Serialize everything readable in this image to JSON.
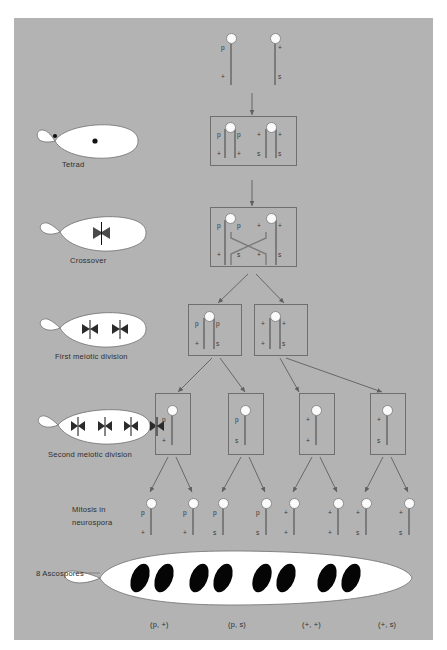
{
  "figure": {
    "background_color": "#b3b3b3",
    "panel_color": "#b3b3b3",
    "line_color": "#7b7b7b",
    "text_color": "#333333",
    "spore_color": "#000000",
    "ascus_color": "#ffffff"
  },
  "stages": [
    {
      "id": "parents",
      "label": ""
    },
    {
      "id": "tetrad",
      "label": "Tetrad"
    },
    {
      "id": "crossover",
      "label": "Crossover"
    },
    {
      "id": "first",
      "label": "First meiotic division"
    },
    {
      "id": "second",
      "label": "Second meiotic division"
    },
    {
      "id": "mitosis",
      "label": "Mitosis in\nneurospora",
      "label_line1": "Mitosis in",
      "label_line2": "neurospora"
    },
    {
      "id": "ascospores",
      "label": "8 Ascospores"
    }
  ],
  "alleles": {
    "p": "p",
    "s": "s",
    "wild": "+"
  },
  "parents": {
    "chromosomes": [
      {
        "top": "p",
        "bottom": "+"
      },
      {
        "top": "+",
        "bottom": "s"
      }
    ]
  },
  "tetrad": {
    "chromatids": [
      {
        "top": "p",
        "bottom": "+"
      },
      {
        "top": "p",
        "bottom": "+"
      },
      {
        "top": "+",
        "bottom": "s"
      },
      {
        "top": "+",
        "bottom": "s"
      }
    ]
  },
  "crossover": {
    "chromatids": [
      {
        "top": "p",
        "bottom": "+"
      },
      {
        "top": "p",
        "bottom": "s"
      },
      {
        "top": "+",
        "bottom": "+"
      },
      {
        "top": "+",
        "bottom": "s"
      }
    ],
    "note": "inner chromatids cross"
  },
  "first_division": {
    "cells": [
      {
        "chromatids": [
          {
            "top": "p",
            "bottom": "+"
          },
          {
            "top": "p",
            "bottom": "s"
          }
        ]
      },
      {
        "chromatids": [
          {
            "top": "+",
            "bottom": "+"
          },
          {
            "top": "+",
            "bottom": "s"
          }
        ]
      }
    ]
  },
  "second_division": {
    "cells": [
      {
        "chromatid": {
          "top": "p",
          "bottom": "+"
        }
      },
      {
        "chromatid": {
          "top": "p",
          "bottom": "s"
        }
      },
      {
        "chromatid": {
          "top": "+",
          "bottom": "+"
        }
      },
      {
        "chromatid": {
          "top": "+",
          "bottom": "s"
        }
      }
    ]
  },
  "mitosis": {
    "nuclei": [
      {
        "top": "p",
        "bottom": "+"
      },
      {
        "top": "p",
        "bottom": "+"
      },
      {
        "top": "p",
        "bottom": "s"
      },
      {
        "top": "p",
        "bottom": "s"
      },
      {
        "top": "+",
        "bottom": "+"
      },
      {
        "top": "+",
        "bottom": "+"
      },
      {
        "top": "+",
        "bottom": "s"
      },
      {
        "top": "+",
        "bottom": "s"
      }
    ]
  },
  "ascospores": {
    "count": 8,
    "pairs": 4
  },
  "genotypes": [
    "(p, +)",
    "(p, s)",
    "(+, +)",
    "(+, s)"
  ]
}
